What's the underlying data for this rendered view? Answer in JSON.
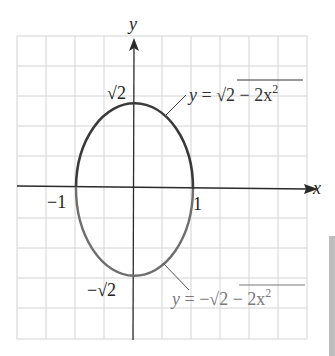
{
  "diagram": {
    "type": "graph-of-ellipse",
    "axes": {
      "x_label": "x",
      "y_label": "y"
    },
    "tick_labels": {
      "x_neg": "−1",
      "x_pos": "1",
      "y_pos": "√2",
      "y_neg": "−√2"
    },
    "curves": [
      {
        "name": "upper",
        "equation_label": "y = √2 − 2x²",
        "color": "#3a3a3a"
      },
      {
        "name": "lower",
        "equation_label": "y = −√2 − 2x²",
        "color": "#6e6e6e"
      }
    ],
    "labels": {
      "upper_y": "y",
      "upper_eq": " = √",
      "upper_rad": "2 − 2x",
      "upper_sup": "2",
      "lower_y": "y",
      "lower_eq": " = −√",
      "lower_rad": "2 − 2x",
      "lower_sup": "2"
    },
    "grid": {
      "columns": 10,
      "rows": 10,
      "color": "#d4d4d4"
    },
    "colors": {
      "axis": "#2a2a2a",
      "upper_curve": "#3a3a3a",
      "lower_curve": "#6e6e6e",
      "lower_label": "#7a7a7a",
      "side_strip": "#bdbdbd"
    }
  }
}
